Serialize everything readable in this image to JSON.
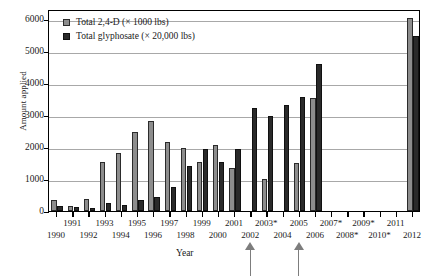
{
  "chart_data": {
    "type": "bar",
    "title": "",
    "xlabel": "Year",
    "ylabel": "Amount applied",
    "ylim": [
      0,
      6300
    ],
    "y_ticks": [
      0,
      1000,
      2000,
      3000,
      4000,
      5000,
      6000
    ],
    "y_tick_labels": [
      "0",
      "1000",
      "2000",
      "3000",
      "4000",
      "5000",
      "6000"
    ],
    "grid": "horizontal",
    "legend_position": "top-left",
    "categories": [
      "1990",
      "1991",
      "1992",
      "1993",
      "1994",
      "1995",
      "1996",
      "1997",
      "1998",
      "1999",
      "2000",
      "2001",
      "2002",
      "2003*",
      "2004",
      "2005",
      "2006",
      "2007*",
      "2008*",
      "2009*",
      "2010*",
      "2011",
      "2012"
    ],
    "series": [
      {
        "name": "Total 2,4-D (× 1000 lbs)",
        "color": "#8d8d8d",
        "values": [
          340,
          150,
          370,
          1540,
          1820,
          2460,
          2820,
          2140,
          1960,
          1520,
          2060,
          1350,
          0,
          1010,
          0,
          1510,
          3520,
          0,
          0,
          0,
          0,
          0,
          6010
        ]
      },
      {
        "name": "Total glyphosate (× 20,000 lbs)",
        "color": "#2a2a2a",
        "values": [
          160,
          130,
          110,
          250,
          190,
          330,
          440,
          760,
          1400,
          1930,
          1520,
          1930,
          3210,
          2950,
          3300,
          3560,
          4590,
          0,
          0,
          0,
          0,
          0,
          5450
        ]
      }
    ],
    "annotations": [
      {
        "label": "",
        "at_category": "2002",
        "type": "up-arrow"
      },
      {
        "label": "",
        "at_category": "2005",
        "type": "up-arrow"
      }
    ]
  },
  "legend": {
    "items": [
      {
        "label": "Total 2,4-D (× 1000 lbs)"
      },
      {
        "label": "Total glyphosate (× 20,000 lbs)"
      }
    ]
  },
  "axes": {
    "y_title": "Amount applied",
    "x_title": "Year"
  }
}
